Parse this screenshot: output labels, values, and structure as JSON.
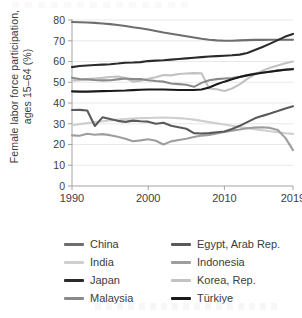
{
  "figure": {
    "ylabel": "Female labor force participation, ages 15–64 (%)",
    "xlabel": ""
  },
  "axis": {
    "y_ticks": [
      "0",
      "10",
      "20",
      "30",
      "40",
      "50",
      "60",
      "70",
      "80"
    ],
    "x_ticks": [
      "1990",
      "2000",
      "2010",
      "2019"
    ]
  },
  "legend": {
    "left_column": [
      {
        "label": "China",
        "color": "#6e6e6e",
        "key": "china"
      },
      {
        "label": "India",
        "color": "#cfcfcf",
        "key": "india"
      },
      {
        "label": "Japan",
        "color": "#2b2b2b",
        "key": "japan"
      },
      {
        "label": "Malaysia",
        "color": "#8a8a8a",
        "key": "malaysia"
      }
    ],
    "right_column": [
      {
        "label": "Egypt, Arab Rep.",
        "color": "#5a5a5a",
        "key": "egypt"
      },
      {
        "label": "Indonesia",
        "color": "#9e9e9e",
        "key": "indonesia"
      },
      {
        "label": "Korea, Rep.",
        "color": "#c2c2c2",
        "key": "korea"
      },
      {
        "label": "Türkiye",
        "color": "#1a1a1a",
        "key": "turkiye"
      }
    ]
  },
  "chart_data": {
    "type": "line",
    "title": "",
    "xlabel": "",
    "ylabel": "Female labor force participation, ages 15–64 (%)",
    "xlim": [
      1990,
      2019
    ],
    "ylim": [
      0,
      80
    ],
    "ytick_values": [
      0,
      10,
      20,
      30,
      40,
      50,
      60,
      70,
      80
    ],
    "xtick_values": [
      1990,
      2000,
      2010,
      2019
    ],
    "grid": "horizontal",
    "legend_position": "below",
    "x": [
      1990,
      1991,
      1992,
      1993,
      1994,
      1995,
      1996,
      1997,
      1998,
      1999,
      2000,
      2001,
      2002,
      2003,
      2004,
      2005,
      2006,
      2007,
      2008,
      2009,
      2010,
      2011,
      2012,
      2013,
      2014,
      2015,
      2016,
      2017,
      2018,
      2019
    ],
    "series": [
      {
        "name": "China",
        "color": "#6e6e6e",
        "values": [
          79.0,
          78.9,
          78.8,
          78.6,
          78.3,
          78.0,
          77.6,
          77.1,
          76.5,
          76.0,
          75.4,
          74.7,
          74.0,
          73.4,
          72.8,
          72.2,
          71.6,
          71.0,
          70.5,
          70.2,
          70.0,
          70.0,
          70.2,
          70.3,
          70.4,
          70.4,
          70.5,
          70.5,
          70.5,
          70.5
        ]
      },
      {
        "name": "India",
        "color": "#cfcfcf",
        "values": [
          29.3,
          29.8,
          30.3,
          30.8,
          31.2,
          31.6,
          32.0,
          32.3,
          32.5,
          32.7,
          32.8,
          32.9,
          33.0,
          32.9,
          32.7,
          32.4,
          32.0,
          31.4,
          30.8,
          30.2,
          29.6,
          29.0,
          28.4,
          27.9,
          27.4,
          26.9,
          26.4,
          25.9,
          25.4,
          25.1
        ]
      },
      {
        "name": "Japan",
        "color": "#2b2b2b",
        "values": [
          57.3,
          57.8,
          58.1,
          58.3,
          58.5,
          58.7,
          59.0,
          59.4,
          59.5,
          59.7,
          60.2,
          60.4,
          60.6,
          60.9,
          61.2,
          61.5,
          61.8,
          62.1,
          62.4,
          62.6,
          62.8,
          63.0,
          63.3,
          64.1,
          65.5,
          67.0,
          68.6,
          70.3,
          72.0,
          73.3
        ]
      },
      {
        "name": "Malaysia",
        "color": "#8a8a8a",
        "values": [
          52.2,
          51.6,
          51.4,
          51.1,
          50.9,
          51.0,
          51.4,
          51.8,
          51.5,
          51.6,
          51.0,
          50.6,
          50.3,
          49.4,
          49.1,
          48.8,
          47.8,
          49.7,
          51.0,
          51.5,
          51.8,
          52.0,
          52.6,
          53.5,
          54.2,
          54.7,
          55.2,
          55.7,
          56.1,
          56.5
        ]
      },
      {
        "name": "Egypt, Arab Rep.",
        "color": "#5a5a5a",
        "values": [
          36.6,
          36.7,
          36.4,
          28.9,
          33.1,
          32.3,
          31.4,
          30.9,
          31.5,
          31.2,
          31.0,
          30.0,
          30.5,
          29.0,
          28.3,
          27.6,
          25.5,
          25.3,
          25.5,
          25.9,
          26.3,
          27.5,
          29.0,
          30.8,
          32.6,
          33.8,
          34.9,
          36.1,
          37.4,
          38.4
        ]
      },
      {
        "name": "Indonesia",
        "color": "#9e9e9e",
        "values": [
          24.4,
          24.2,
          25.2,
          24.7,
          25.0,
          24.5,
          23.7,
          22.8,
          21.6,
          22.0,
          22.5,
          21.8,
          20.0,
          21.5,
          22.2,
          22.8,
          23.6,
          24.3,
          24.6,
          25.3,
          26.0,
          26.7,
          27.2,
          27.8,
          28.2,
          28.3,
          28.0,
          27.0,
          23.2,
          17.3
        ]
      },
      {
        "name": "Korea, Rep.",
        "color": "#c2c2c2",
        "values": [
          50.9,
          51.0,
          51.5,
          51.8,
          52.1,
          52.5,
          52.8,
          52.0,
          50.3,
          50.7,
          51.7,
          52.4,
          53.5,
          53.3,
          54.0,
          54.2,
          54.4,
          54.3,
          47.0,
          46.6,
          45.8,
          47.0,
          49.0,
          51.6,
          53.8,
          55.6,
          57.0,
          58.1,
          59.2,
          60.0
        ]
      },
      {
        "name": "Türkiye",
        "color": "#1a1a1a",
        "values": [
          45.6,
          45.5,
          45.5,
          45.6,
          45.7,
          45.8,
          45.9,
          46.0,
          46.2,
          46.4,
          46.5,
          46.5,
          46.5,
          46.4,
          46.3,
          46.3,
          46.3,
          46.5,
          47.5,
          49.0,
          50.3,
          51.5,
          52.5,
          53.3,
          54.0,
          54.6,
          55.1,
          55.6,
          56.0,
          56.3
        ]
      }
    ]
  }
}
